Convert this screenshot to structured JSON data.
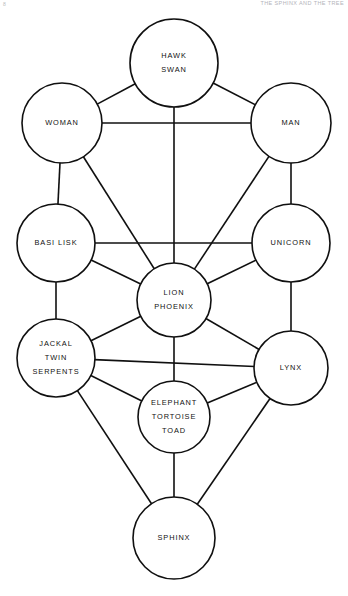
{
  "page": {
    "folio": "8",
    "running_head": "THE SPHINX AND THE TREE",
    "background_color": "#ffffff",
    "ink_color": "#101010"
  },
  "diagram": {
    "type": "node-link-graph",
    "width": 348,
    "height": 596,
    "nodes": [
      {
        "id": "hawk",
        "labels": [
          "HAWK",
          "SWAN"
        ],
        "cx": 174,
        "cy": 63,
        "r": 44
      },
      {
        "id": "woman",
        "labels": [
          "WOMAN"
        ],
        "cx": 62,
        "cy": 123,
        "r": 40
      },
      {
        "id": "man",
        "labels": [
          "MAN"
        ],
        "cx": 291,
        "cy": 123,
        "r": 40
      },
      {
        "id": "basilisk",
        "labels": [
          "BASI LISK"
        ],
        "cx": 56,
        "cy": 243,
        "r": 39
      },
      {
        "id": "unicorn",
        "labels": [
          "UNICORN"
        ],
        "cx": 291,
        "cy": 243,
        "r": 39
      },
      {
        "id": "lion",
        "labels": [
          "LION",
          "PHOENIX"
        ],
        "cx": 174,
        "cy": 300,
        "r": 37
      },
      {
        "id": "jackal",
        "labels": [
          "JACKAL",
          "TWIN",
          "SERPENTS"
        ],
        "cx": 56,
        "cy": 358,
        "r": 39
      },
      {
        "id": "lynx",
        "labels": [
          "LYNX"
        ],
        "cx": 291,
        "cy": 368,
        "r": 37
      },
      {
        "id": "elephant",
        "labels": [
          "ELEPHANT",
          "TORTOISE",
          "TOAD"
        ],
        "cx": 174,
        "cy": 417,
        "r": 36
      },
      {
        "id": "sphinx",
        "labels": [
          "SPHINX"
        ],
        "cx": 174,
        "cy": 538,
        "r": 41
      }
    ],
    "edges": [
      {
        "from": "hawk",
        "to": "woman"
      },
      {
        "from": "hawk",
        "to": "man"
      },
      {
        "from": "hawk",
        "to": "lion"
      },
      {
        "from": "woman",
        "to": "man"
      },
      {
        "from": "woman",
        "to": "basilisk"
      },
      {
        "from": "woman",
        "to": "lion"
      },
      {
        "from": "man",
        "to": "unicorn"
      },
      {
        "from": "man",
        "to": "lion"
      },
      {
        "from": "basilisk",
        "to": "unicorn"
      },
      {
        "from": "basilisk",
        "to": "lion"
      },
      {
        "from": "basilisk",
        "to": "jackal"
      },
      {
        "from": "unicorn",
        "to": "lion"
      },
      {
        "from": "unicorn",
        "to": "lynx"
      },
      {
        "from": "lion",
        "to": "jackal"
      },
      {
        "from": "lion",
        "to": "lynx"
      },
      {
        "from": "lion",
        "to": "elephant"
      },
      {
        "from": "jackal",
        "to": "lynx"
      },
      {
        "from": "jackal",
        "to": "elephant"
      },
      {
        "from": "jackal",
        "to": "sphinx"
      },
      {
        "from": "lynx",
        "to": "elephant"
      },
      {
        "from": "lynx",
        "to": "sphinx"
      },
      {
        "from": "elephant",
        "to": "sphinx"
      }
    ]
  }
}
